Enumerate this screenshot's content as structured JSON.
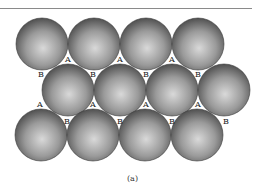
{
  "figure": {
    "caption": "(a)",
    "rows": [
      {
        "row": 1,
        "sphere_count": 4
      },
      {
        "row": 2,
        "sphere_count": 4
      },
      {
        "row": 3,
        "sphere_count": 4
      }
    ],
    "site_labels": {
      "A": "A",
      "B": "B"
    },
    "colors": {
      "sphere_highlight": "#d9d9d9",
      "sphere_mid": "#9a9a9a",
      "sphere_shadow": "#4a4a4a",
      "void": "#ffffff"
    }
  }
}
